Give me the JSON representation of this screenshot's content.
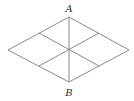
{
  "diagram": {
    "type": "rhombus-subdivided",
    "labels": {
      "top": "A",
      "bottom": "B"
    },
    "colors": {
      "stroke": "#8a8a8a",
      "label": "#333333",
      "background": "#ffffff"
    },
    "vertices": {
      "top": [
        69,
        17
      ],
      "right": [
        129,
        50
      ],
      "bottom": [
        69,
        82
      ],
      "left": [
        8,
        50
      ]
    }
  }
}
